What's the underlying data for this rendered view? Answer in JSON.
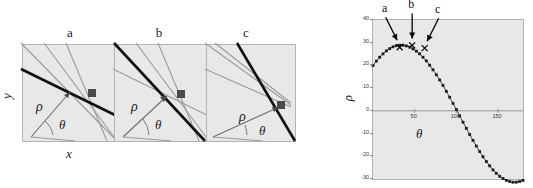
{
  "figure": {
    "left_panels": {
      "axis_x_label": "x",
      "axis_y_label": "y",
      "rho_symbol": "ρ",
      "theta_symbol": "θ",
      "panels": [
        {
          "letter": "a",
          "bold_line_angle_deg": 25,
          "rho_arrow_angle_deg": 55,
          "description": "bold line with shallow slope through common point"
        },
        {
          "letter": "b",
          "bold_line_angle_deg": 38,
          "rho_arrow_angle_deg": 40,
          "description": "bold line with medium slope through common point"
        },
        {
          "letter": "c",
          "bold_line_angle_deg": 62,
          "rho_arrow_angle_deg": 18,
          "description": "bold line steep, nearly vertical, through common point"
        }
      ]
    }
  },
  "chart_data": {
    "type": "line",
    "title": "",
    "xlabel": "θ",
    "ylabel": "ρ",
    "xlim": [
      0,
      180
    ],
    "ylim": [
      -30,
      40
    ],
    "xticks": [
      50,
      100,
      150
    ],
    "yticks": [
      40,
      30,
      20,
      10,
      0,
      -10,
      -20,
      -30
    ],
    "grid": false,
    "legend": "none",
    "marker": "filled-square",
    "annotations": [
      {
        "label": "a",
        "theta": 32,
        "rho": 28.0
      },
      {
        "label": "b",
        "theta": 47,
        "rho": 28.8
      },
      {
        "label": "c",
        "theta": 62,
        "rho": 27.6
      }
    ],
    "series": [
      {
        "name": "rho(theta)",
        "x": [
          0,
          4,
          8,
          12,
          16,
          20,
          24,
          28,
          32,
          36,
          40,
          44,
          48,
          52,
          56,
          60,
          64,
          68,
          72,
          76,
          80,
          84,
          88,
          92,
          96,
          100,
          104,
          108,
          112,
          116,
          120,
          124,
          128,
          132,
          136,
          140,
          144,
          148,
          152,
          156,
          160,
          164,
          168,
          172,
          176,
          180
        ],
        "y": [
          20.0,
          21.9,
          23.6,
          25.1,
          26.4,
          27.4,
          28.2,
          28.7,
          28.9,
          28.9,
          28.6,
          28.1,
          27.3,
          26.3,
          25.1,
          23.6,
          22.0,
          20.1,
          18.1,
          15.9,
          13.6,
          11.2,
          8.6,
          6.0,
          3.3,
          0.6,
          -2.2,
          -5.0,
          -7.7,
          -10.4,
          -13.0,
          -15.5,
          -17.9,
          -20.2,
          -22.3,
          -24.2,
          -26.0,
          -27.5,
          -28.8,
          -29.8,
          -30.6,
          -31.1,
          -31.4,
          -31.4,
          -31.1,
          -30.6
        ]
      }
    ]
  }
}
